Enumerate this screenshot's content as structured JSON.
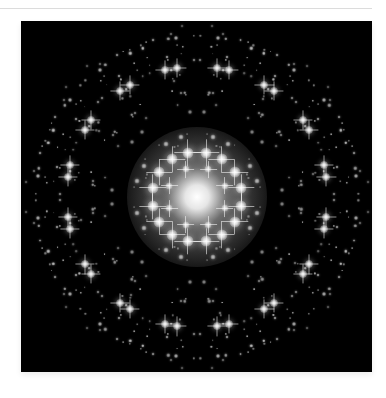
{
  "image": {
    "alt": "Diffraction pattern with eight-fold symmetric bright spots on black background",
    "background": "#000000",
    "spot_color": "#ffffff",
    "center": [
      176,
      176
    ],
    "symmetry": 8,
    "central_glow": {
      "radius": 70,
      "core_radius": 16
    },
    "rings": [
      {
        "name": "inner-ring-a",
        "radius": 30,
        "offset_deg": 22.5,
        "pair_split_deg": 0,
        "size": 7,
        "brightness": 0.85,
        "star": true
      },
      {
        "name": "inner-ring-b",
        "radius": 45,
        "offset_deg": 0,
        "pair_split_deg": 12,
        "size": 11,
        "brightness": 1.0,
        "star": true
      },
      {
        "name": "mid-ring-a",
        "radius": 62,
        "offset_deg": 22.5,
        "pair_split_deg": 8,
        "size": 5,
        "brightness": 0.7,
        "star": false
      },
      {
        "name": "mid-ring-b",
        "radius": 85,
        "offset_deg": 0,
        "pair_split_deg": 5,
        "size": 4,
        "brightness": 0.55,
        "star": false
      },
      {
        "name": "mid-ring-c",
        "radius": 105,
        "offset_deg": 22.5,
        "pair_split_deg": 14,
        "size": 3,
        "brightness": 0.5,
        "star": false
      },
      {
        "name": "outer-ring",
        "radius": 131,
        "offset_deg": 0,
        "pair_split_deg": 9,
        "size": 8,
        "brightness": 0.95,
        "star": true
      },
      {
        "name": "outer-ring-b",
        "radius": 131,
        "offset_deg": 22.5,
        "pair_split_deg": 8.5,
        "size": 8,
        "brightness": 0.95,
        "star": true
      },
      {
        "name": "edge-ring",
        "radius": 160,
        "offset_deg": 0,
        "pair_split_deg": 7.5,
        "size": 4,
        "brightness": 0.7,
        "star": false
      },
      {
        "name": "edge-ring-b",
        "radius": 118,
        "offset_deg": 11.25,
        "pair_split_deg": 0,
        "size": 3,
        "brightness": 0.45,
        "star": false
      }
    ],
    "scatter": {
      "count": 420,
      "min_radius": 55,
      "max_radius": 172,
      "seed": 7
    }
  }
}
